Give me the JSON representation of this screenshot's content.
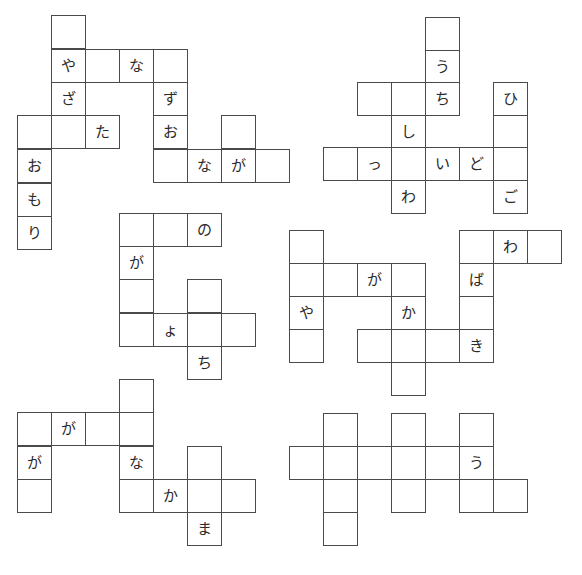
{
  "cell_size": {
    "w": 34,
    "h": 33
  },
  "puzzles": [
    {
      "id": "puzzle-1",
      "cells": [
        {
          "x": 52,
          "y": 16,
          "char": ""
        },
        {
          "x": 52,
          "y": 50,
          "char": "や"
        },
        {
          "x": 86,
          "y": 50,
          "char": ""
        },
        {
          "x": 120,
          "y": 50,
          "char": "な"
        },
        {
          "x": 154,
          "y": 50,
          "char": ""
        },
        {
          "x": 52,
          "y": 83,
          "char": "ざ"
        },
        {
          "x": 154,
          "y": 83,
          "char": "ず"
        },
        {
          "x": 18,
          "y": 116,
          "char": ""
        },
        {
          "x": 52,
          "y": 116,
          "char": ""
        },
        {
          "x": 86,
          "y": 116,
          "char": "た"
        },
        {
          "x": 154,
          "y": 116,
          "char": "お"
        },
        {
          "x": 222,
          "y": 116,
          "char": ""
        },
        {
          "x": 18,
          "y": 150,
          "char": "お"
        },
        {
          "x": 154,
          "y": 150,
          "char": ""
        },
        {
          "x": 188,
          "y": 150,
          "char": "な"
        },
        {
          "x": 222,
          "y": 150,
          "char": "が"
        },
        {
          "x": 256,
          "y": 150,
          "char": ""
        },
        {
          "x": 18,
          "y": 184,
          "char": "も"
        },
        {
          "x": 18,
          "y": 217,
          "char": "り"
        }
      ]
    },
    {
      "id": "puzzle-2",
      "cells": [
        {
          "x": 426,
          "y": 18,
          "char": ""
        },
        {
          "x": 426,
          "y": 51,
          "char": "う"
        },
        {
          "x": 358,
          "y": 83,
          "char": ""
        },
        {
          "x": 392,
          "y": 83,
          "char": ""
        },
        {
          "x": 426,
          "y": 83,
          "char": "ち"
        },
        {
          "x": 494,
          "y": 83,
          "char": "ひ"
        },
        {
          "x": 392,
          "y": 116,
          "char": "し"
        },
        {
          "x": 494,
          "y": 116,
          "char": ""
        },
        {
          "x": 324,
          "y": 148,
          "char": ""
        },
        {
          "x": 358,
          "y": 148,
          "char": "っ"
        },
        {
          "x": 392,
          "y": 148,
          "char": ""
        },
        {
          "x": 426,
          "y": 148,
          "char": "い"
        },
        {
          "x": 460,
          "y": 148,
          "char": "ど"
        },
        {
          "x": 494,
          "y": 148,
          "char": ""
        },
        {
          "x": 392,
          "y": 181,
          "char": "わ"
        },
        {
          "x": 494,
          "y": 181,
          "char": "ご"
        }
      ]
    },
    {
      "id": "puzzle-3",
      "cells": [
        {
          "x": 120,
          "y": 214,
          "char": ""
        },
        {
          "x": 154,
          "y": 214,
          "char": ""
        },
        {
          "x": 188,
          "y": 214,
          "char": "の"
        },
        {
          "x": 120,
          "y": 247,
          "char": "が"
        },
        {
          "x": 120,
          "y": 280,
          "char": ""
        },
        {
          "x": 188,
          "y": 280,
          "char": ""
        },
        {
          "x": 120,
          "y": 314,
          "char": ""
        },
        {
          "x": 154,
          "y": 314,
          "char": "ょ"
        },
        {
          "x": 188,
          "y": 314,
          "char": ""
        },
        {
          "x": 222,
          "y": 314,
          "char": ""
        },
        {
          "x": 188,
          "y": 347,
          "char": "ち"
        }
      ]
    },
    {
      "id": "puzzle-4",
      "cells": [
        {
          "x": 290,
          "y": 231,
          "char": ""
        },
        {
          "x": 460,
          "y": 231,
          "char": ""
        },
        {
          "x": 494,
          "y": 231,
          "char": "わ"
        },
        {
          "x": 528,
          "y": 231,
          "char": ""
        },
        {
          "x": 290,
          "y": 264,
          "char": ""
        },
        {
          "x": 324,
          "y": 264,
          "char": ""
        },
        {
          "x": 358,
          "y": 264,
          "char": "が"
        },
        {
          "x": 392,
          "y": 264,
          "char": ""
        },
        {
          "x": 460,
          "y": 264,
          "char": "ば"
        },
        {
          "x": 290,
          "y": 297,
          "char": "や"
        },
        {
          "x": 392,
          "y": 297,
          "char": "か"
        },
        {
          "x": 460,
          "y": 297,
          "char": ""
        },
        {
          "x": 290,
          "y": 330,
          "char": ""
        },
        {
          "x": 358,
          "y": 330,
          "char": ""
        },
        {
          "x": 392,
          "y": 330,
          "char": ""
        },
        {
          "x": 426,
          "y": 330,
          "char": ""
        },
        {
          "x": 460,
          "y": 330,
          "char": "き"
        },
        {
          "x": 392,
          "y": 363,
          "char": ""
        }
      ]
    },
    {
      "id": "puzzle-5",
      "cells": [
        {
          "x": 120,
          "y": 380,
          "char": ""
        },
        {
          "x": 18,
          "y": 413,
          "char": ""
        },
        {
          "x": 52,
          "y": 413,
          "char": "が"
        },
        {
          "x": 86,
          "y": 413,
          "char": ""
        },
        {
          "x": 120,
          "y": 413,
          "char": ""
        },
        {
          "x": 18,
          "y": 447,
          "char": "が"
        },
        {
          "x": 120,
          "y": 447,
          "char": "な"
        },
        {
          "x": 188,
          "y": 447,
          "char": ""
        },
        {
          "x": 18,
          "y": 480,
          "char": ""
        },
        {
          "x": 120,
          "y": 480,
          "char": ""
        },
        {
          "x": 154,
          "y": 480,
          "char": "か"
        },
        {
          "x": 188,
          "y": 480,
          "char": ""
        },
        {
          "x": 222,
          "y": 480,
          "char": ""
        },
        {
          "x": 188,
          "y": 513,
          "char": "ま"
        }
      ]
    },
    {
      "id": "puzzle-6",
      "cells": [
        {
          "x": 324,
          "y": 414,
          "char": ""
        },
        {
          "x": 392,
          "y": 414,
          "char": ""
        },
        {
          "x": 460,
          "y": 414,
          "char": ""
        },
        {
          "x": 290,
          "y": 447,
          "char": ""
        },
        {
          "x": 324,
          "y": 447,
          "char": ""
        },
        {
          "x": 358,
          "y": 447,
          "char": ""
        },
        {
          "x": 392,
          "y": 447,
          "char": ""
        },
        {
          "x": 426,
          "y": 447,
          "char": ""
        },
        {
          "x": 460,
          "y": 447,
          "char": "う"
        },
        {
          "x": 324,
          "y": 480,
          "char": ""
        },
        {
          "x": 392,
          "y": 480,
          "char": ""
        },
        {
          "x": 460,
          "y": 480,
          "char": ""
        },
        {
          "x": 494,
          "y": 480,
          "char": ""
        },
        {
          "x": 324,
          "y": 513,
          "char": ""
        }
      ]
    }
  ]
}
